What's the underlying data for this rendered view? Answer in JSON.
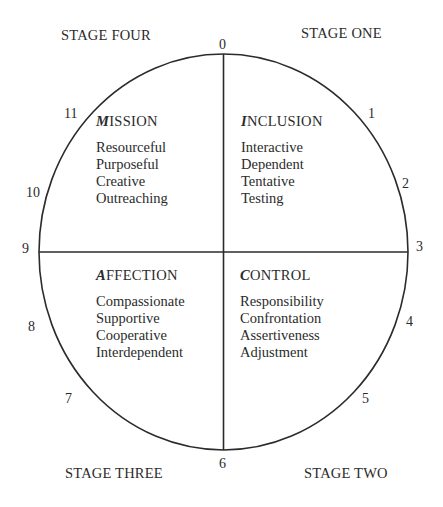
{
  "stages": {
    "one": "STAGE ONE",
    "two": "STAGE TWO",
    "three": "STAGE THREE",
    "four": "STAGE FOUR"
  },
  "clock": [
    "0",
    "1",
    "2",
    "3",
    "4",
    "5",
    "6",
    "7",
    "8",
    "9",
    "10",
    "11"
  ],
  "quadrants": {
    "inclusion": {
      "initial": "I",
      "rest": "NCLUSION",
      "traits": [
        "Interactive",
        "Dependent",
        "Tentative",
        "Testing"
      ]
    },
    "control": {
      "initial": "C",
      "rest": "ONTROL",
      "traits": [
        "Responsibility",
        "Confrontation",
        "Assertiveness",
        "Adjustment"
      ]
    },
    "affection": {
      "initial": "A",
      "rest": "FFECTION",
      "traits": [
        "Compassionate",
        "Supportive",
        "Cooperative",
        "Interdependent"
      ]
    },
    "mission": {
      "initial": "M",
      "rest": "ISSION",
      "traits": [
        "Resourceful",
        "Purposeful",
        "Creative",
        "Outreaching"
      ]
    }
  },
  "colors": {
    "line": "#2b2b2b",
    "background": "#ffffff"
  }
}
